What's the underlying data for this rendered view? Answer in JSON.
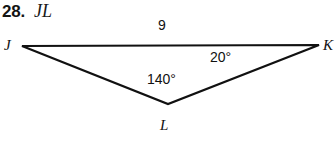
{
  "problem": {
    "number": "28.",
    "prompt": "JL"
  },
  "figure": {
    "name": "triangle-jkl",
    "vertices": [
      {
        "name": "J",
        "label": "J"
      },
      {
        "name": "K",
        "label": "K"
      },
      {
        "name": "L",
        "label": "L"
      }
    ],
    "side_labels": [
      {
        "name": "JK",
        "label": "9"
      }
    ],
    "angle_labels": [
      {
        "name": "L",
        "label": "140°"
      },
      {
        "name": "K",
        "label": "20°"
      }
    ],
    "stroke_color": "#111111",
    "background_color": "#ffffff"
  },
  "geometry": {
    "type": "triangle",
    "points": {
      "J": {
        "x": 22,
        "y": 46
      },
      "K": {
        "x": 319,
        "y": 45
      },
      "L": {
        "x": 168,
        "y": 104
      }
    }
  }
}
